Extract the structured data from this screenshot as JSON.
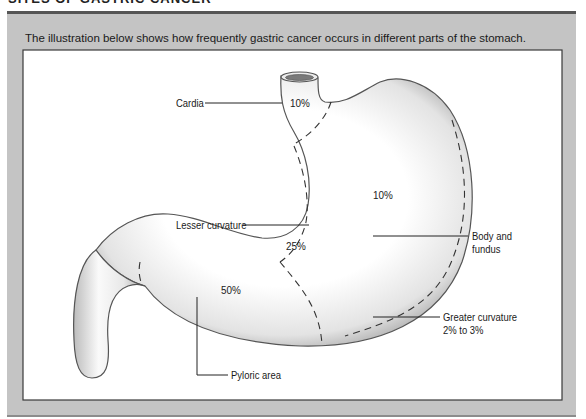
{
  "section_title": "SITES OF GASTRIC CANCER",
  "caption": "The illustration below shows how frequently gastric cancer occurs in different parts of the stomach.",
  "regions": [
    {
      "name": "Cardia",
      "label": "Cardia",
      "percent": "10%"
    },
    {
      "name": "Body and fundus",
      "label_line1": "Body and",
      "label_line2": "fundus",
      "percent": "10%"
    },
    {
      "name": "Lesser curvature",
      "label": "Lesser curvature",
      "percent": "25%"
    },
    {
      "name": "Pyloric area",
      "label": "Pyloric area",
      "percent": "50%"
    },
    {
      "name": "Greater curvature",
      "label_line1": "Greater curvature",
      "label_line2": "2% to 3%"
    }
  ],
  "colors": {
    "panel_gray": "#c4c4c4",
    "frame_border": "#3a3a3a",
    "stomach_shade": "#bdbdbd"
  }
}
